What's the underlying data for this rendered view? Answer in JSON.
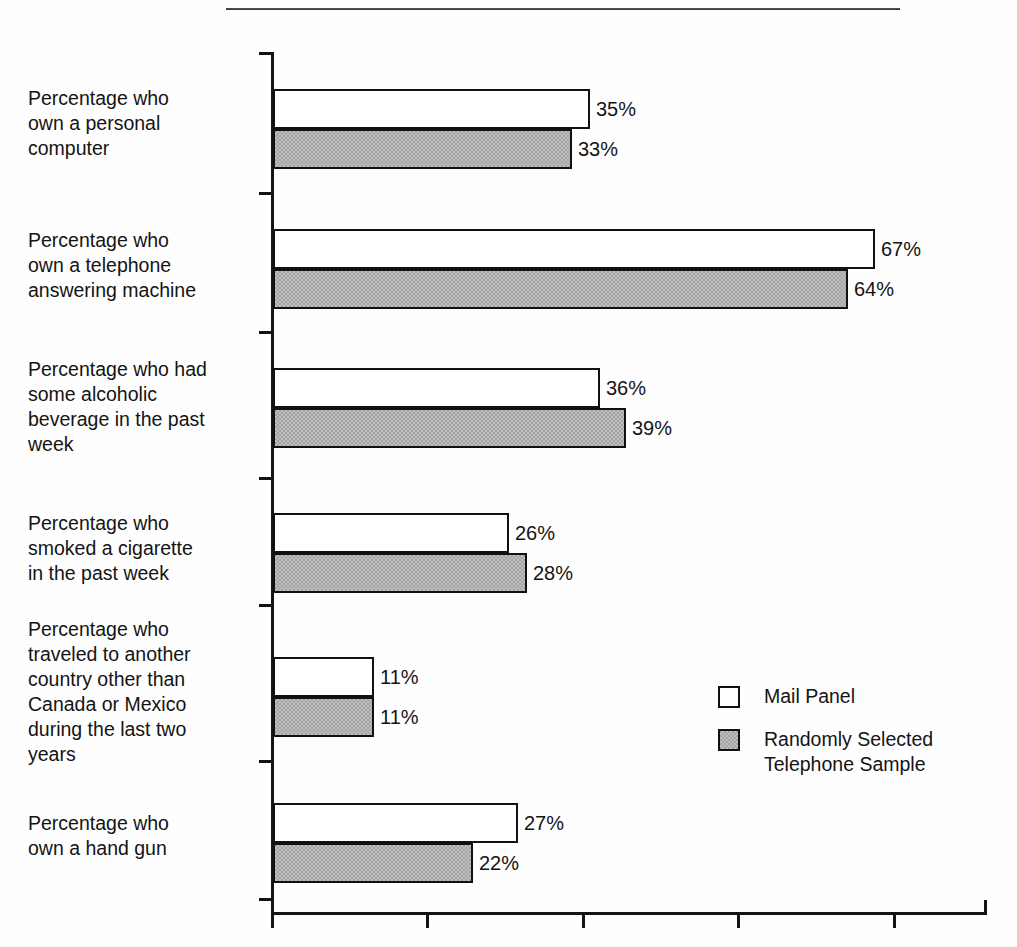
{
  "figure": {
    "title_partial": "",
    "has_top_rule": true,
    "note": "title text is cropped off above the top edge of the image"
  },
  "legend": {
    "position": "middle-right",
    "entries": [
      {
        "label": "Mail Panel",
        "swatch": "white-square",
        "color": "#ffffff"
      },
      {
        "label": "Randomly Selected Telephone Sample",
        "swatch": "gray-square",
        "color": "#a3a3a3"
      }
    ]
  },
  "axis": {
    "x_ticks_visible": true,
    "x_tick_labels": [],
    "y_tick_marks": 7
  },
  "chart_data": {
    "type": "bar",
    "orientation": "horizontal",
    "title": "",
    "xlabel": "",
    "ylabel": "",
    "xlim": [
      0,
      79
    ],
    "grid": false,
    "legend_position": "middle-right",
    "value_suffix": "%",
    "categories": [
      "Percentage who own a personal computer",
      "Percentage who own a telephone answering machine",
      "Percentage who had some alcoholic beverage in the past week",
      "Percentage who smoked a cigarette in the past week",
      "Percentage who traveled to another country other than Canada or Mexico during the last two years",
      "Percentage who own a hand gun"
    ],
    "series": [
      {
        "name": "Mail Panel",
        "values": [
          35,
          67,
          36,
          26,
          11,
          27
        ],
        "labels": [
          "35%",
          "67%",
          "36%",
          "26%",
          "11%",
          "27%"
        ]
      },
      {
        "name": "Randomly Selected Telephone Sample",
        "values": [
          33,
          64,
          39,
          28,
          11,
          22
        ],
        "labels": [
          "33%",
          "64%",
          "39%",
          "28%",
          "11%",
          "22%"
        ]
      }
    ]
  },
  "groups": [
    {
      "label_lines": [
        "Percentage who",
        "own a personal",
        "computer"
      ],
      "label_top": 86,
      "bars_top": 89,
      "light": {
        "value": "35%",
        "width": 317
      },
      "dark": {
        "value": "33%",
        "width": 299
      }
    },
    {
      "label_lines": [
        "Percentage who",
        "own a telephone",
        "answering machine"
      ],
      "label_top": 228,
      "bars_top": 229,
      "light": {
        "value": "67%",
        "width": 602
      },
      "dark": {
        "value": "64%",
        "width": 575
      }
    },
    {
      "label_lines": [
        "Percentage who had",
        "some alcoholic",
        "beverage in the past",
        "week"
      ],
      "label_top": 357,
      "bars_top": 368,
      "light": {
        "value": "36%",
        "width": 327
      },
      "dark": {
        "value": "39%",
        "width": 353
      }
    },
    {
      "label_lines": [
        "Percentage who",
        "smoked a cigarette",
        "in the past week"
      ],
      "label_top": 511,
      "bars_top": 513,
      "light": {
        "value": "26%",
        "width": 236
      },
      "dark": {
        "value": "28%",
        "width": 254
      }
    },
    {
      "label_lines": [
        "Percentage who",
        "traveled to another",
        "country other than",
        "Canada or Mexico",
        "during the last two",
        "years"
      ],
      "label_top": 617,
      "bars_top": 657,
      "light": {
        "value": "11%",
        "width": 101
      },
      "dark": {
        "value": "11%",
        "width": 101
      }
    },
    {
      "label_lines": [
        "Percentage who",
        "own a hand gun"
      ],
      "label_top": 811,
      "bars_top": 803,
      "light": {
        "value": "27%",
        "width": 245
      },
      "dark": {
        "value": "22%",
        "width": 200
      }
    }
  ],
  "y_tick_positions": [
    52,
    192,
    331,
    477,
    604,
    760,
    898
  ],
  "x_tick_positions": [
    271,
    426,
    582,
    737,
    893
  ]
}
